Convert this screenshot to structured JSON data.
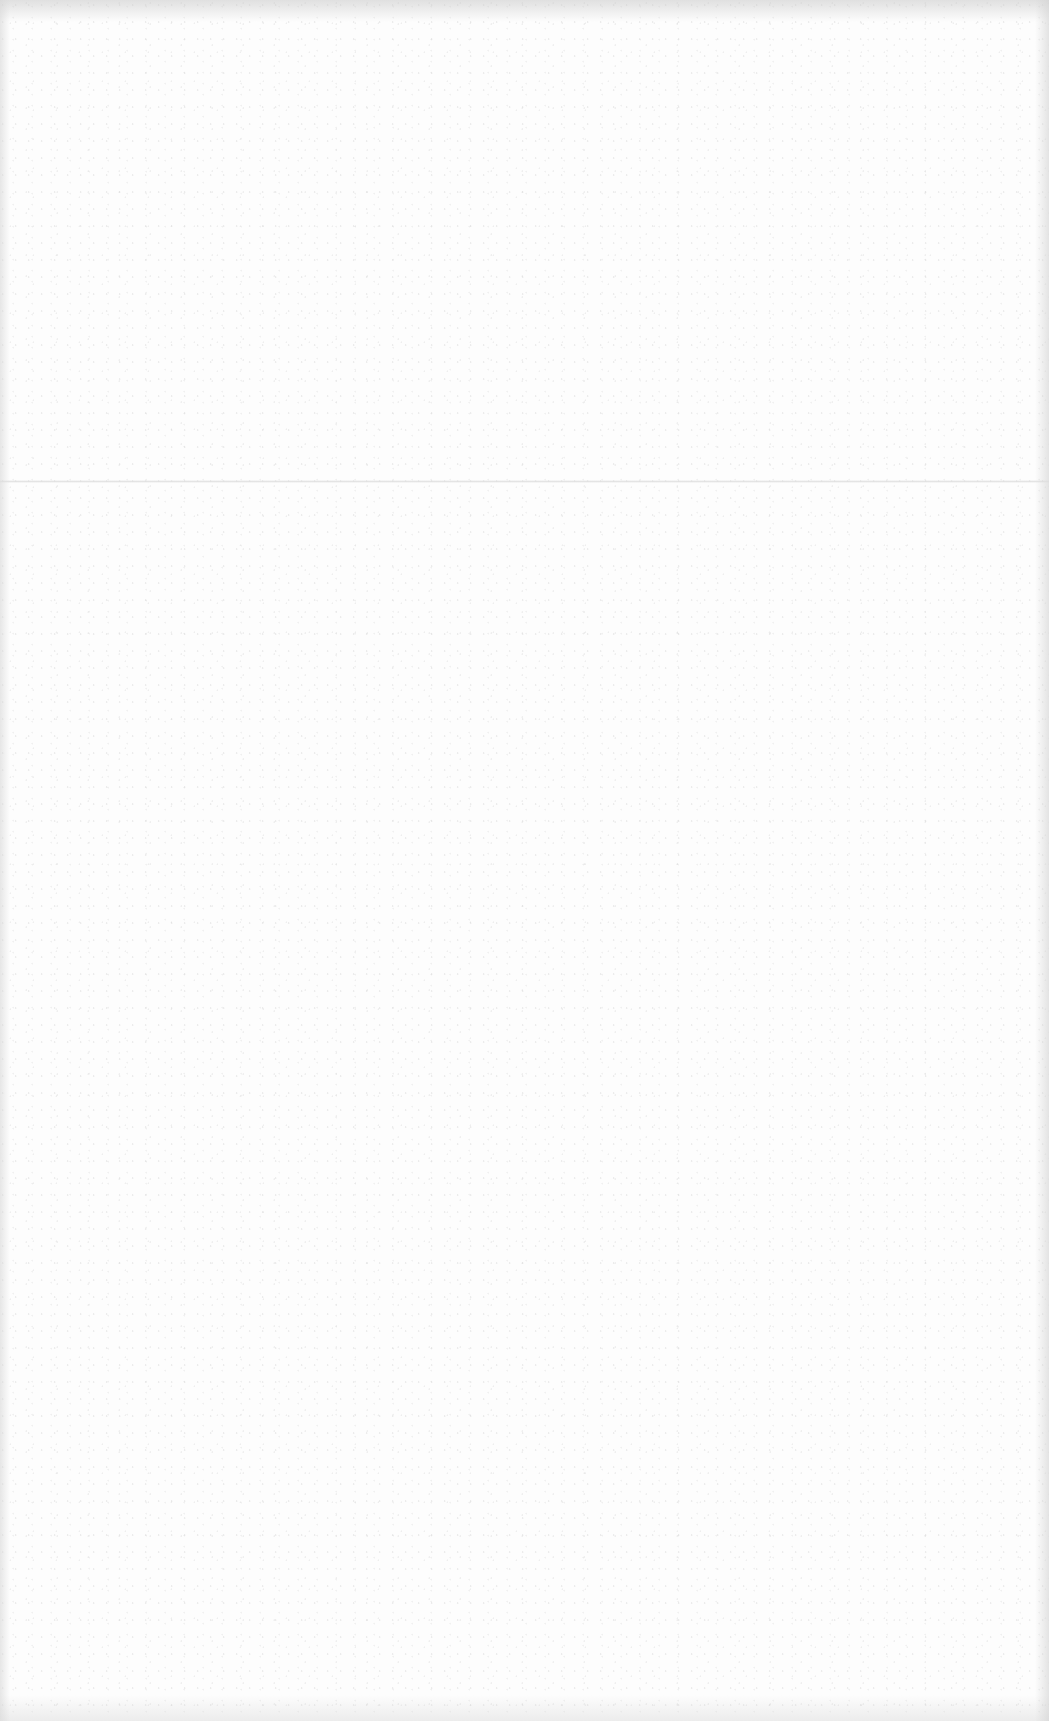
{
  "document": {
    "type": "blank-scanned-page",
    "text_content": [],
    "background_color": "#fdfdfd",
    "fold_line_y": 480
  }
}
